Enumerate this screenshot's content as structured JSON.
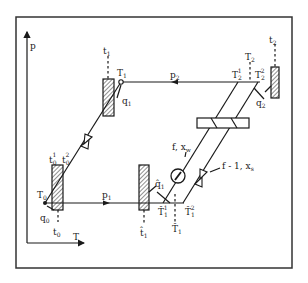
{
  "diagram": {
    "type": "p-T phase diagram of a two-pressure cycle with heat exchangers",
    "axes": {
      "y_label": "p",
      "x_label": "T"
    },
    "pressure_lines": [
      {
        "id": "p1",
        "label": "p",
        "sub": "1"
      },
      {
        "id": "p2",
        "label": "p",
        "sub": "2"
      }
    ],
    "points": {
      "T0": {
        "label": "T",
        "sub": "0"
      },
      "T1": {
        "label": "T",
        "sub": "1"
      },
      "T2": {
        "label": "T",
        "sub": "2"
      },
      "T2_1": {
        "label": "T",
        "sub": "2",
        "sup": "1"
      },
      "T2_2": {
        "label": "T",
        "sub": "2",
        "sup": "2"
      },
      "T1hat": {
        "label": "T̂",
        "sub": "1"
      },
      "T1hat_1": {
        "label": "T̂",
        "sub": "1",
        "sup": "1"
      },
      "T1hat_2": {
        "label": "T̂",
        "sub": "1",
        "sup": "2"
      }
    },
    "reservoirs": [
      {
        "id": "t0",
        "label": "t",
        "sub": "0",
        "sup_labels": [
          "t₀¹",
          "t₀²"
        ]
      },
      {
        "id": "t1",
        "label": "t",
        "sub": "1"
      },
      {
        "id": "t1hat",
        "label": "t̂",
        "sub": "1"
      },
      {
        "id": "t2",
        "label": "t",
        "sub": "2"
      }
    ],
    "heat_flows": [
      {
        "id": "q0",
        "label": "q",
        "sub": "0"
      },
      {
        "id": "q1",
        "label": "q",
        "sub": "1"
      },
      {
        "id": "q1hat",
        "label": "q̂",
        "sub": "1"
      },
      {
        "id": "q2",
        "label": "q",
        "sub": "2"
      }
    ],
    "streams": [
      {
        "id": "stream-f",
        "label": "f, x",
        "sub": "w"
      },
      {
        "id": "stream-f-1",
        "label": "f - 1, x",
        "sub": "s"
      }
    ]
  }
}
